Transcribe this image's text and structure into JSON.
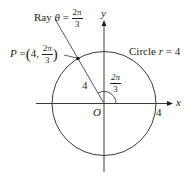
{
  "diagram": {
    "type": "polar-coordinate-figure",
    "axes": {
      "x_label": "x",
      "y_label": "y",
      "origin_label": "O"
    },
    "circle": {
      "label": "Circle r = 4",
      "label_prefix": "Circle",
      "label_var": "r",
      "label_eq": "= 4",
      "radius_value": "4"
    },
    "ray": {
      "label_prefix": "Ray",
      "label_var": "θ",
      "label_eq": "=",
      "angle_num": "2π",
      "angle_den": "3"
    },
    "point": {
      "label_var": "P",
      "label_eq": "=",
      "r_value": "4,",
      "theta_num": "2π",
      "theta_den": "3"
    },
    "segment_label": "4",
    "angle_label": {
      "num": "2π",
      "den": "3"
    },
    "x_intercept_label": "4",
    "colors": {
      "ink": "#231f20",
      "background": "#ffffff"
    }
  }
}
